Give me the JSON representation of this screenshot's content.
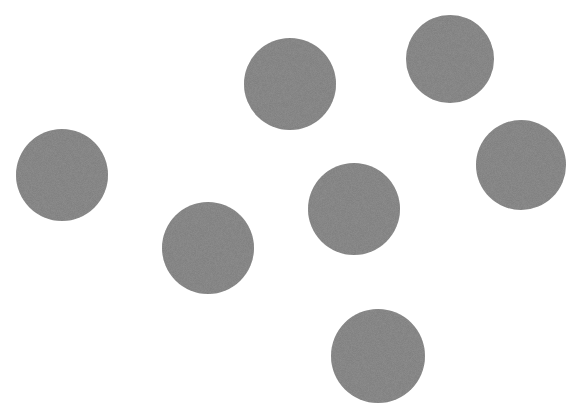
{
  "scene": {
    "background": "#ffffff",
    "dot_color": "#7a7a7a",
    "dots": [
      {
        "cx": 62,
        "cy": 175,
        "r": 46
      },
      {
        "cx": 208,
        "cy": 248,
        "r": 46
      },
      {
        "cx": 290,
        "cy": 84,
        "r": 46
      },
      {
        "cx": 354,
        "cy": 209,
        "r": 46
      },
      {
        "cx": 450,
        "cy": 59,
        "r": 44
      },
      {
        "cx": 521,
        "cy": 165,
        "r": 45
      },
      {
        "cx": 378,
        "cy": 356,
        "r": 47
      }
    ]
  }
}
